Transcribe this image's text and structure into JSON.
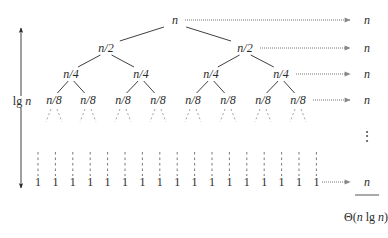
{
  "root": {
    "label": "n",
    "x": 175,
    "y": 24
  },
  "levels": [
    {
      "depth": 1,
      "labels": [
        "n/2",
        "n/2"
      ],
      "xs": [
        106,
        245
      ],
      "y": 52
    },
    {
      "depth": 2,
      "labels": [
        "n/4",
        "n/4",
        "n/4",
        "n/4"
      ],
      "xs": [
        71,
        141,
        211,
        281
      ],
      "y": 78
    },
    {
      "depth": 3,
      "labels": [
        "n/8",
        "n/8",
        "n/8",
        "n/8",
        "n/8",
        "n/8",
        "n/8",
        "n/8"
      ],
      "xs": [
        54,
        88,
        123,
        158,
        193,
        228,
        263,
        298
      ],
      "y": 104
    }
  ],
  "leaves": {
    "label": "1",
    "count": 17,
    "x_start": 38,
    "x_step": 17.4,
    "y": 186
  },
  "height_label": {
    "prefix": "lg",
    "var": "n"
  },
  "level_costs": [
    {
      "label": "n",
      "y": 24
    },
    {
      "label": "n",
      "y": 52
    },
    {
      "label": "n",
      "y": 78
    },
    {
      "label": "n",
      "y": 104
    },
    {
      "label": "⋮",
      "y": 140
    },
    {
      "label": "n",
      "y": 186
    }
  ],
  "total": {
    "theta": "Θ(",
    "n1": "n",
    "lg": " lg ",
    "n2": "n",
    "close": ")"
  },
  "colors": {
    "ink": "#2a2a2a",
    "arrow": "#777777",
    "dashed": "#8a8a8a"
  }
}
